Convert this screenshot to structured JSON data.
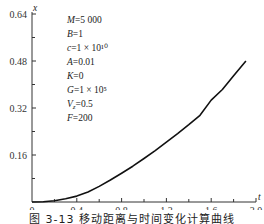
{
  "chart_data": {
    "type": "line",
    "title": "",
    "caption": "图 3-13  移动距离与时间变化计算曲线",
    "xlabel": "t",
    "ylabel": "x",
    "xlim": [
      0,
      2.0
    ],
    "ylim": [
      0,
      0.64
    ],
    "x_ticks": [
      "0",
      "0.4",
      "0.8",
      "1.2",
      "1.6",
      "2.0"
    ],
    "y_ticks": [
      "0.16",
      "0.32",
      "0.48",
      "0.64"
    ],
    "grid": false,
    "legend": null,
    "series": [
      {
        "name": "x(t)",
        "x": [
          0,
          0.1,
          0.2,
          0.3,
          0.4,
          0.5,
          0.6,
          0.7,
          0.8,
          0.9,
          1.0,
          1.1,
          1.2,
          1.3,
          1.4,
          1.5,
          1.6,
          1.7,
          1.8,
          1.91
        ],
        "y": [
          0,
          0.001,
          0.004,
          0.011,
          0.02,
          0.034,
          0.053,
          0.075,
          0.098,
          0.122,
          0.148,
          0.175,
          0.204,
          0.233,
          0.263,
          0.295,
          0.347,
          0.383,
          0.43,
          0.48
        ]
      }
    ],
    "annotations": [
      {
        "label": "M",
        "value": "=5 000"
      },
      {
        "label": "B",
        "value": "=1"
      },
      {
        "label": "c",
        "value": "=1 × 10¹⁰"
      },
      {
        "label": "A",
        "value": "=0.01"
      },
      {
        "label": "K",
        "value": "=0"
      },
      {
        "label": "G",
        "value": "=1 × 10⁵"
      },
      {
        "label": "V",
        "sub": "z",
        "value": "=0.5"
      },
      {
        "label": "F",
        "value": "=200"
      }
    ]
  }
}
